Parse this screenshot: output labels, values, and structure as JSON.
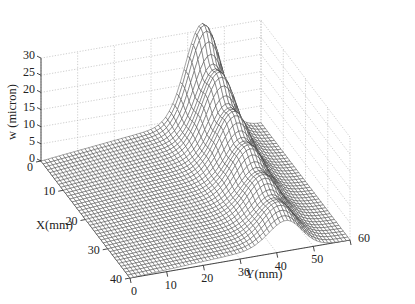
{
  "chart_data": {
    "type": "surface",
    "title": "",
    "xlabel": "X(mm)",
    "ylabel": "Y(mm)",
    "zlabel": "w (micron)",
    "x_ticks": [
      0,
      10,
      20,
      30,
      40
    ],
    "y_ticks": [
      0,
      10,
      20,
      30,
      40,
      50,
      60
    ],
    "z_ticks": [
      0,
      5,
      10,
      15,
      20,
      25,
      30
    ],
    "xlim": [
      0,
      40
    ],
    "ylim": [
      0,
      60
    ],
    "zlim": [
      0,
      30
    ],
    "grid": true,
    "colormap": "white faces, dark mesh edges",
    "surface_model": {
      "description": "Ridge along X centered near Y≈45 mm, peak ≈28 micron at X≈0, decaying to ≈5 micron at X=40; gentle ramp at low Y; small waviness on the ridge front.",
      "ridge_center_y": 44,
      "ridge_width_y": 6.5,
      "peak_w": 28,
      "far_x_w": 5,
      "base_ramp_w": 4,
      "grid_nx": 40,
      "grid_ny": 60
    },
    "sample_points": [
      {
        "X": 0,
        "Y": 0,
        "w": 0.5
      },
      {
        "X": 0,
        "Y": 30,
        "w": 6
      },
      {
        "X": 0,
        "Y": 45,
        "w": 28
      },
      {
        "X": 0,
        "Y": 58,
        "w": 2
      },
      {
        "X": 20,
        "Y": 45,
        "w": 14
      },
      {
        "X": 40,
        "Y": 45,
        "w": 5
      },
      {
        "X": 40,
        "Y": 10,
        "w": 2
      }
    ]
  },
  "axes": {
    "z_label": "w (micron)",
    "x_label": "X(mm)",
    "y_label": "Y(mm)"
  }
}
